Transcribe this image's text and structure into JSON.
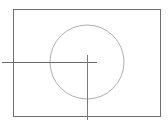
{
  "diagram": {
    "width": 168,
    "height": 124,
    "background": "#ffffff",
    "stroke_color": "#7a7a7a",
    "frame": {
      "x": 13,
      "y": 9,
      "width": 147,
      "height": 107,
      "stroke": "#6e6e6e"
    },
    "circle": {
      "cx": 87,
      "cy": 62,
      "r": 37,
      "stroke": "#9a9a9a"
    },
    "crosshair": {
      "horizontal": {
        "x1": 2,
        "y1": 62,
        "x2": 97,
        "y2": 62,
        "stroke": "#6a6a6a"
      },
      "vertical": {
        "x1": 87,
        "y1": 55,
        "x2": 87,
        "y2": 120,
        "stroke": "#7a7a7a"
      }
    }
  }
}
